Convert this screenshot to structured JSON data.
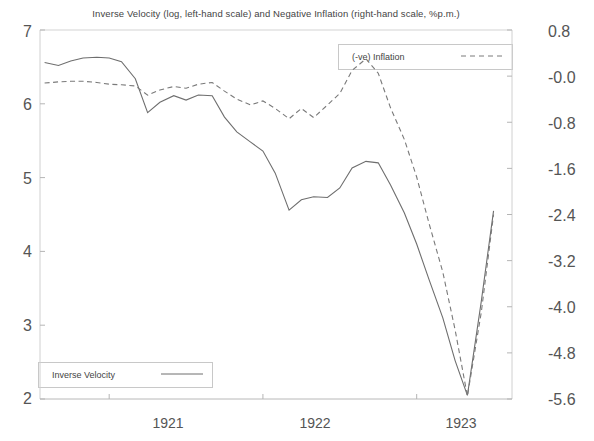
{
  "chart_data": {
    "type": "line",
    "title": "Inverse Velocity (log, left-hand scale) and Negative Inflation (right-hand scale, %p.m.)",
    "xlabel": "",
    "ylabel": "",
    "grid": false,
    "legend_position": "inside",
    "x_ticks": [
      "1921",
      "1922",
      "1923"
    ],
    "x_tick_positions": [
      1921.0,
      1922.0,
      1923.0
    ],
    "xlim": [
      1920.55,
      1923.62
    ],
    "left_axis": {
      "label": "Inverse Velocity (log)",
      "ticks": [
        "7",
        "6",
        "5",
        "4",
        "3",
        "2"
      ],
      "tick_values": [
        7,
        6,
        5,
        4,
        3,
        2
      ],
      "ylim": [
        2,
        7
      ]
    },
    "right_axis": {
      "label": "Negative Inflation (%p.m.)",
      "ticks": [
        "0.8",
        "-0.0",
        "-0.8",
        "-1.6",
        "-2.4",
        "-3.2",
        "-4.0",
        "-4.8",
        "-5.6"
      ],
      "tick_values": [
        0.8,
        0.0,
        -0.8,
        -1.6,
        -2.4,
        -3.2,
        -4.0,
        -4.8,
        -5.6
      ],
      "ylim": [
        -5.6,
        0.8
      ]
    },
    "series": [
      {
        "name": "Inverse Velocity",
        "style": "solid",
        "axis": "left",
        "color": "#6e6e6e",
        "x": [
          1920.58,
          1920.67,
          1920.75,
          1920.83,
          1920.92,
          1921.0,
          1921.08,
          1921.17,
          1921.25,
          1921.33,
          1921.42,
          1921.5,
          1921.58,
          1921.67,
          1921.75,
          1921.83,
          1921.92,
          1922.0,
          1922.08,
          1922.17,
          1922.25,
          1922.33,
          1922.42,
          1922.5,
          1922.58,
          1922.67,
          1922.75,
          1922.83,
          1922.92,
          1923.0,
          1923.08,
          1923.17,
          1923.25,
          1923.33,
          1923.42,
          1923.5
        ],
        "y": [
          6.56,
          6.52,
          6.58,
          6.62,
          6.63,
          6.62,
          6.57,
          6.34,
          5.88,
          6.02,
          6.11,
          6.05,
          6.12,
          6.11,
          5.82,
          5.62,
          5.48,
          5.36,
          5.06,
          4.56,
          4.7,
          4.74,
          4.73,
          4.86,
          5.13,
          5.22,
          5.2,
          4.9,
          4.52,
          4.1,
          3.62,
          3.1,
          2.52,
          2.05,
          3.32,
          4.55
        ]
      },
      {
        "name": "(-ve) Inflation",
        "style": "dashed",
        "axis": "right",
        "color": "#7a7a7a",
        "x": [
          1920.58,
          1920.67,
          1920.75,
          1920.83,
          1920.92,
          1921.0,
          1921.08,
          1921.17,
          1921.25,
          1921.33,
          1921.42,
          1921.5,
          1921.58,
          1921.67,
          1921.75,
          1921.83,
          1921.92,
          1922.0,
          1922.08,
          1922.17,
          1922.25,
          1922.33,
          1922.42,
          1922.5,
          1922.58,
          1922.67,
          1922.75,
          1922.83,
          1922.92,
          1923.0,
          1923.08,
          1923.17,
          1923.25,
          1923.33,
          1923.42,
          1923.5
        ],
        "y": [
          -0.12,
          -0.1,
          -0.09,
          -0.09,
          -0.11,
          -0.14,
          -0.15,
          -0.17,
          -0.33,
          -0.24,
          -0.18,
          -0.21,
          -0.14,
          -0.11,
          -0.26,
          -0.4,
          -0.5,
          -0.43,
          -0.56,
          -0.74,
          -0.56,
          -0.72,
          -0.5,
          -0.3,
          0.1,
          0.3,
          0.05,
          -0.55,
          -1.1,
          -1.75,
          -2.55,
          -3.4,
          -4.4,
          -5.55,
          -4.1,
          -2.4
        ]
      }
    ]
  },
  "legends": {
    "inflation": {
      "label": "(-ve) Inflation",
      "style": "dashed"
    },
    "inverse_velocity": {
      "label": "Inverse Velocity",
      "style": "solid"
    }
  }
}
